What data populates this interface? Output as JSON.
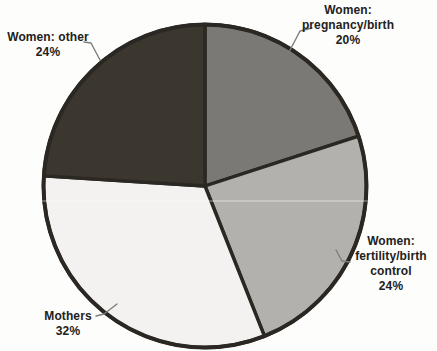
{
  "chart_data": {
    "type": "pie",
    "title": "",
    "categories": [
      "Women: pregnancy/birth",
      "Women: fertility/birth control",
      "Mothers",
      "Women: other"
    ],
    "values": [
      20,
      24,
      32,
      24
    ],
    "unit": "%",
    "slices": [
      {
        "label": "Women: pregnancy/birth",
        "value": 20,
        "color": "#7b7976"
      },
      {
        "label": "Women: fertility/birth control",
        "value": 24,
        "color": "#b3b1ad"
      },
      {
        "label": "Mothers",
        "value": 32,
        "color": "#f3f2f1"
      },
      {
        "label": "Women: other",
        "value": 24,
        "color": "#3c372e"
      }
    ],
    "start_angle_deg": -90,
    "direction": "clockwise",
    "outline_color": "#2b2823",
    "leader_line_color": "#7d7d7b",
    "legend_position": "none",
    "label_style": "outside-callouts"
  },
  "callouts": {
    "pregnancy": {
      "text": "Women:\npregnancy/birth\n20%"
    },
    "fertility": {
      "text": "Women:\nfertility/birth\ncontrol\n24%"
    },
    "mothers": {
      "text": "Mothers\n32%"
    },
    "other": {
      "text": "Women: other\n24%"
    }
  }
}
